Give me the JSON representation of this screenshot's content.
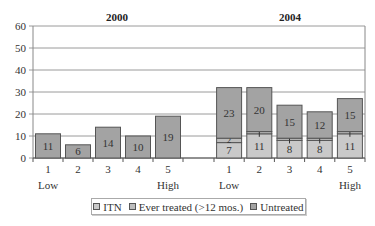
{
  "chart_data": {
    "type": "bar",
    "stacked": true,
    "ylim": [
      0,
      60
    ],
    "yticks": [
      0,
      10,
      20,
      30,
      40,
      50,
      60
    ],
    "grid": true,
    "legend_position": "bottom",
    "legend": [
      "ITN",
      "Ever treated (>12 mos.)",
      "Untreated"
    ],
    "colors": {
      "ITN": "#c9c9c9",
      "Ever treated": "#bdbdbd",
      "Untreated": "#a3a3a3",
      "border": "#555555",
      "grid": "#9a9a9a"
    },
    "panels": [
      {
        "title": "2000",
        "categories": [
          "1",
          "2",
          "3",
          "4",
          "5"
        ],
        "category_sublabels": [
          "Low",
          "",
          "",
          "",
          "High"
        ],
        "series": [
          {
            "name": "ITN",
            "values": [
              0,
              0,
              0,
              0,
              0
            ]
          },
          {
            "name": "Ever treated (>12 mos.)",
            "values": [
              0,
              0,
              0,
              0,
              0
            ]
          },
          {
            "name": "Untreated",
            "values": [
              11,
              6,
              14,
              10,
              19
            ]
          }
        ],
        "labels": [
          [
            "",
            "",
            "11"
          ],
          [
            "",
            "",
            "6"
          ],
          [
            "",
            "",
            "14"
          ],
          [
            "",
            "",
            "10"
          ],
          [
            "",
            "",
            "19"
          ]
        ]
      },
      {
        "title": "2004",
        "categories": [
          "1",
          "2",
          "3",
          "4",
          "5"
        ],
        "category_sublabels": [
          "Low",
          "",
          "",
          "",
          "High"
        ],
        "series": [
          {
            "name": "ITN",
            "values": [
              7,
              11,
              8,
              8,
              11
            ]
          },
          {
            "name": "Ever treated (>12 mos.)",
            "values": [
              2,
              1,
              1,
              1,
              1
            ]
          },
          {
            "name": "Untreated",
            "values": [
              23,
              20,
              15,
              12,
              15
            ]
          }
        ],
        "labels": [
          [
            "7",
            "2",
            "23"
          ],
          [
            "11",
            "1",
            "20"
          ],
          [
            "8",
            "1",
            "15"
          ],
          [
            "8",
            "1",
            "12"
          ],
          [
            "11",
            "1",
            "15"
          ]
        ]
      }
    ]
  },
  "legend": {
    "items": [
      {
        "label": "ITN",
        "color": "#c9c9c9"
      },
      {
        "label": "Ever treated (>12 mos.)",
        "color": "#bdbdbd"
      },
      {
        "label": "Untreated",
        "color": "#a3a3a3"
      }
    ]
  }
}
